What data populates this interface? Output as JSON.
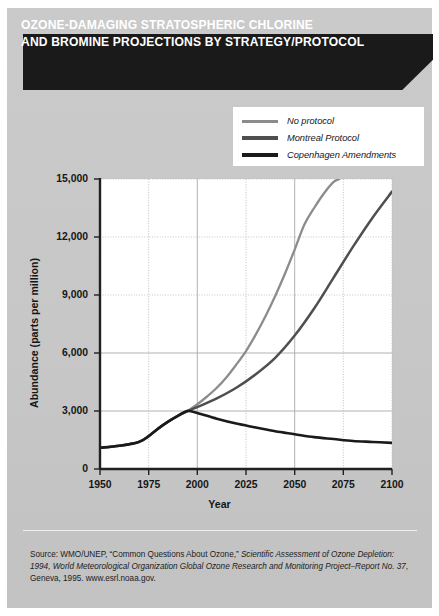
{
  "title": {
    "line1": "OZONE-DAMAGING STRATOSPHERIC CHLORINE",
    "line2": "AND BROMINE PROJECTIONS BY STRATEGY/PROTOCOL"
  },
  "source_note": {
    "full": "Source: WMO/UNEP, “Common Questions About Ozone,” Scientific Assessment of Ozone Depletion: 1994, World Meteorological Organization Global Ozone Research and Monitoring Project–Report No. 37, Geneva, 1995. www.esrl.noaa.gov.",
    "prefix": "Source: WMO/UNEP, “Common Questions About Ozone,” ",
    "italic1": "Scientific Assessment of Ozone Depletion: 1994, World Meteorological Organization Global Ozone Research and Monitoring Project–Report No. 37",
    "suffix": ", Geneva, 1995. www.esrl.noaa.gov."
  },
  "colors": {
    "card_background": "#c9c9c9",
    "banner_background": "#1a1a1a",
    "banner_text": "#ffffff",
    "plot_background": "#ffffff",
    "axis": "#231f20",
    "grid_solid": "#a9a9a9",
    "grid_dotted": "#b8b8b8",
    "series_no_protocol": "#8c8c8c",
    "series_montreal": "#4f4f4f",
    "series_copenhagen": "#1a1a1a"
  },
  "chart_data": {
    "type": "line",
    "title": "OZONE-DAMAGING STRATOSPHERIC CHLORINE AND BROMINE PROJECTIONS BY STRATEGY/PROTOCOL",
    "xlabel": "Year",
    "ylabel": "Abundance (parts per million)",
    "xlim": [
      1950,
      2100
    ],
    "ylim": [
      0,
      15000
    ],
    "xticks": [
      1950,
      1975,
      2000,
      2025,
      2050,
      2075,
      2100
    ],
    "xtick_labels": [
      "1950",
      "1975",
      "2000",
      "2025",
      "2050",
      "2075",
      "2100"
    ],
    "yticks": [
      0,
      3000,
      6000,
      9000,
      12000,
      15000
    ],
    "ytick_labels": [
      "0",
      "3,000",
      "6,000",
      "9,000",
      "12,000",
      "15,000"
    ],
    "grid": "solid gridlines at 2000 and 2050; dotted gridlines at 1975, 2025, 2075; horizontal gridlines at every 3,000",
    "legend_position": "top-right, outside plot, white box",
    "series": [
      {
        "name": "No protocol",
        "color": "#8c8c8c",
        "x": [
          1950,
          1960,
          1970,
          1975,
          1980,
          1985,
          1990,
          1995,
          2000,
          2005,
          2010,
          2015,
          2020,
          2025,
          2030,
          2035,
          2040,
          2045,
          2050,
          2055,
          2060,
          2065,
          2070,
          2073
        ],
        "values": [
          1100,
          1200,
          1400,
          1700,
          2100,
          2450,
          2750,
          3000,
          3350,
          3750,
          4200,
          4750,
          5400,
          6100,
          6950,
          7900,
          8950,
          10100,
          11350,
          12650,
          13500,
          14250,
          14850,
          15000
        ]
      },
      {
        "name": "Montreal Protocol",
        "color": "#4f4f4f",
        "x": [
          1950,
          1960,
          1970,
          1975,
          1980,
          1985,
          1990,
          1995,
          2000,
          2010,
          2020,
          2030,
          2040,
          2050,
          2060,
          2070,
          2080,
          2090,
          2100
        ],
        "values": [
          1100,
          1200,
          1400,
          1700,
          2100,
          2450,
          2750,
          3000,
          3200,
          3650,
          4200,
          4900,
          5750,
          6900,
          8300,
          9900,
          11500,
          13000,
          14350
        ]
      },
      {
        "name": "Copenhagen Amendments",
        "color": "#1a1a1a",
        "x": [
          1950,
          1960,
          1970,
          1975,
          1980,
          1985,
          1990,
          1995,
          2000,
          2010,
          2020,
          2030,
          2040,
          2050,
          2060,
          2070,
          2080,
          2090,
          2100
        ],
        "values": [
          1100,
          1200,
          1400,
          1700,
          2100,
          2450,
          2750,
          3000,
          2900,
          2600,
          2350,
          2150,
          1950,
          1800,
          1650,
          1550,
          1450,
          1400,
          1350
        ]
      }
    ]
  },
  "axes": {
    "ylabel": "Abundance (parts per million)",
    "xlabel": "Year"
  }
}
